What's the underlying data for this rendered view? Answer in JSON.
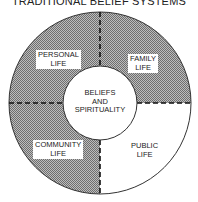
{
  "title": "TRADITIONAL BELIEF SYSTEMS",
  "center": {
    "line1": "BELIEFS",
    "line2": "AND",
    "line3": "SPIRITUALITY"
  },
  "quadrants": [
    {
      "id": "personal",
      "line1": "PERSONAL",
      "line2": "LIFE",
      "position": "top-left",
      "fill": "hatched"
    },
    {
      "id": "family",
      "line1": "FAMILY",
      "line2": "LIFE",
      "position": "top-right",
      "fill": "hatched"
    },
    {
      "id": "community",
      "line1": "COMMUNITY",
      "line2": "LIFE",
      "position": "bottom-left",
      "fill": "hatched"
    },
    {
      "id": "public",
      "line1": "PUBLIC",
      "line2": "LIFE",
      "position": "bottom-right",
      "fill": "white"
    }
  ],
  "colors": {
    "hatch_dark": "#6e6e6e",
    "hatch_light": "#bdbdbd",
    "stroke": "#333333",
    "background": "#ffffff"
  }
}
